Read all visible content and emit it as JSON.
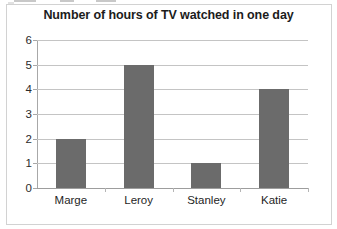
{
  "chart_data": {
    "type": "bar",
    "title": "Number of hours of TV watched in one day",
    "categories": [
      "Marge",
      "Leroy",
      "Stanley",
      "Katie"
    ],
    "values": [
      2,
      5,
      1,
      4
    ],
    "xlabel": "",
    "ylabel": "",
    "ylim": [
      0,
      6
    ],
    "yticks": [
      0,
      1,
      2,
      3,
      4,
      5,
      6
    ],
    "ytick_labels": [
      "0",
      "1",
      "2",
      "3",
      "4",
      "5",
      "6"
    ],
    "grid": "horizontal",
    "legend": "none",
    "bar_color": "#6b6b6b",
    "gridline_color": "#c4c4c4",
    "axis_color": "#a8a8a8",
    "title_color": "#1c1c1c",
    "background_color": "#ffffff",
    "frame_color": "#d2d2d2"
  }
}
